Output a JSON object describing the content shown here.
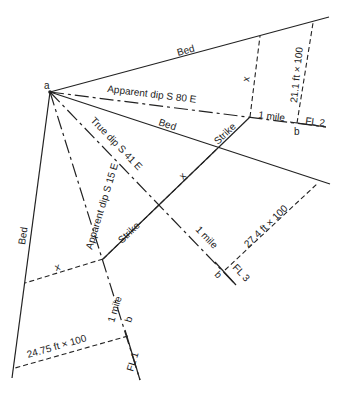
{
  "diagram": {
    "type": "geologic-apparent-dip-construction",
    "origin_label": "a",
    "labels": {
      "bed_top": "Bed",
      "bed_middle": "Bed",
      "bed_left": "Bed",
      "apparent_dip_s80e": "Apparent dip S 80 E",
      "true_dip_s41e": "True dip S 41 E",
      "apparent_dip_s15e": "Apparent dip S 15 E",
      "strike_upper": "Strike",
      "strike_lower": "Strike",
      "x_upper": "x",
      "x_middle": "x",
      "x_lower": "x",
      "one_mile_fl2": "1 mile",
      "one_mile_fl3": "1 mile",
      "one_mile_fl1": "1 mile",
      "b_fl2": "b",
      "b_fl3": "b",
      "b_fl1": "b",
      "fl2": "FL 2",
      "fl3": "FL 3",
      "fl1": "FL 1",
      "depth_fl2": "21.1 ft × 100",
      "depth_fl3": "27.4 ft × 100",
      "depth_fl1": "24.75 ft × 100"
    }
  }
}
